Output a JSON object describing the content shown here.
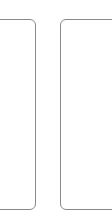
{
  "canvas": {
    "width": 112,
    "height": 216,
    "background_color": "#ffffff"
  },
  "style": {
    "border_color": "#8a8a8a",
    "border_width_px": 1,
    "corner_radius_px": 6,
    "card_fill_color": "#ffffff"
  },
  "layout": {
    "card_top_y": 19,
    "card_bottom_y": 209,
    "card_height_px": 191,
    "gap_between_cards_px": 24,
    "left_card_right_edge_x": 36,
    "right_card_left_edge_x": 60
  },
  "cards": [
    {
      "id": "card-left",
      "label": "",
      "content": "",
      "clipped_edge": "left",
      "fully_visible": false
    },
    {
      "id": "card-right",
      "label": "",
      "content": "",
      "clipped_edge": "right",
      "fully_visible": false
    }
  ]
}
